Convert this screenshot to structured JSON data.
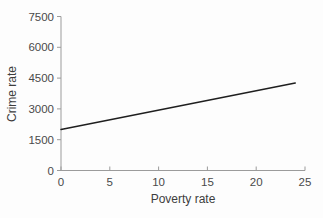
{
  "chart_data": {
    "type": "line",
    "title": "",
    "xlabel": "Poverty rate",
    "ylabel": "Crime rate",
    "xlim": [
      0,
      25
    ],
    "ylim": [
      0,
      7500
    ],
    "x_ticks": [
      0,
      5,
      10,
      15,
      20,
      25
    ],
    "y_ticks": [
      0,
      1500,
      3000,
      4500,
      6000,
      7500
    ],
    "grid": false,
    "legend": false,
    "series": [
      {
        "name": "fitted-regression-line",
        "x": [
          0,
          24
        ],
        "y": [
          2000,
          4260
        ],
        "color": "#1f1f1f",
        "width": 1.5
      }
    ],
    "axis_color": "#9b9b9b",
    "tick_label_color": "#4a4a4a",
    "axis_title_color": "#3d3d3d",
    "background_color": "#fdfdfd"
  }
}
